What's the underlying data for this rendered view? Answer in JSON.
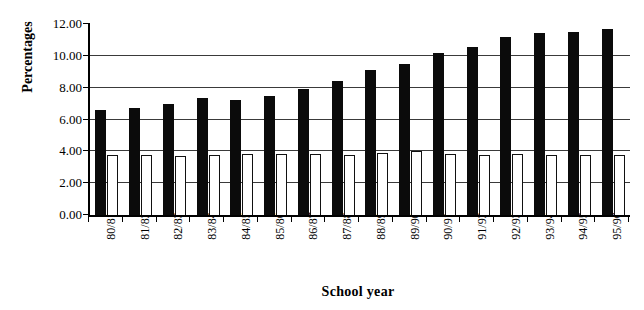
{
  "chart_data": {
    "type": "bar",
    "title": "",
    "xlabel": "School year",
    "ylabel": "Percentages",
    "categories": [
      "80/81",
      "81/82",
      "82/83",
      "83/84",
      "84/85",
      "85/86",
      "86/87",
      "87/88",
      "88/89",
      "89/90",
      "90/91",
      "91/92",
      "92/93",
      "93/94",
      "94/95",
      "95/96"
    ],
    "series": [
      {
        "name": "series-dark",
        "style": "filled-black",
        "values": [
          6.6,
          6.7,
          6.95,
          7.35,
          7.25,
          7.5,
          7.9,
          8.4,
          9.1,
          9.5,
          10.15,
          10.55,
          11.2,
          11.45,
          11.5,
          11.7
        ]
      },
      {
        "name": "series-light",
        "style": "outlined-white",
        "values": [
          3.8,
          3.75,
          3.7,
          3.8,
          3.85,
          3.85,
          3.85,
          3.8,
          3.9,
          4.0,
          3.85,
          3.8,
          3.85,
          3.8,
          3.8,
          3.8
        ]
      }
    ],
    "ylim": [
      0,
      12
    ],
    "yticks": [
      0,
      2,
      4,
      6,
      8,
      10,
      12
    ],
    "ytick_labels": [
      "0.00",
      "2.00",
      "4.00",
      "6.00",
      "8.00",
      "10.00",
      "12.00"
    ],
    "gridlines": [
      2,
      4,
      6,
      8,
      10
    ],
    "grid": true,
    "legend": "none",
    "colors": {
      "series_dark": "#0b0b0b",
      "series_light": "#ffffff",
      "series_light_border": "#111111",
      "axis": "#000000",
      "gridline": "#3a3a3a",
      "background": "#ffffff"
    }
  }
}
